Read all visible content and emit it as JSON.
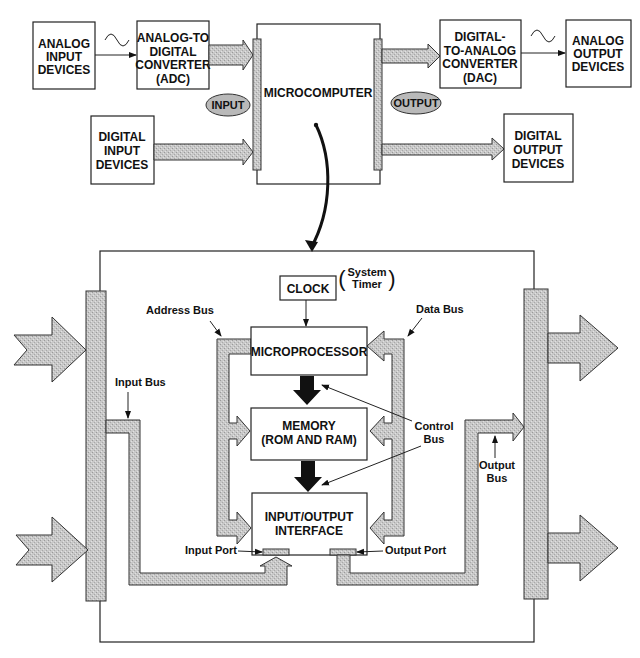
{
  "top": {
    "analog_input": [
      "ANALOG",
      "INPUT",
      "DEVICES"
    ],
    "adc": [
      "ANALOG-TO",
      "DIGITAL",
      "CONVERTER",
      "(ADC)"
    ],
    "digital_input": [
      "DIGITAL",
      "INPUT",
      "DEVICES"
    ],
    "microcomputer": "MICROCOMPUTER",
    "input_tag": "INPUT",
    "output_tag": "OUTPUT",
    "dac": [
      "DIGITAL-",
      "TO-ANALOG",
      "CONVERTER",
      "(DAC)"
    ],
    "analog_output": [
      "ANALOG",
      "OUTPUT",
      "DEVICES"
    ],
    "digital_output": [
      "DIGITAL",
      "OUTPUT",
      "DEVICES"
    ],
    "wave_symbol": "sine-wave-icon"
  },
  "detail": {
    "clock": "CLOCK",
    "system_timer": [
      "System",
      "Timer"
    ],
    "address_bus": "Address Bus",
    "data_bus": "Data Bus",
    "microprocessor": "MICROPROCESSOR",
    "memory": [
      "MEMORY",
      "(ROM AND RAM)"
    ],
    "io_interface": [
      "INPUT/OUTPUT",
      "INTERFACE"
    ],
    "control_bus": [
      "Control",
      "Bus"
    ],
    "input_bus": "Input Bus",
    "output_bus": [
      "Output",
      "Bus"
    ],
    "input_port": "Input Port",
    "output_port": "Output Port"
  }
}
